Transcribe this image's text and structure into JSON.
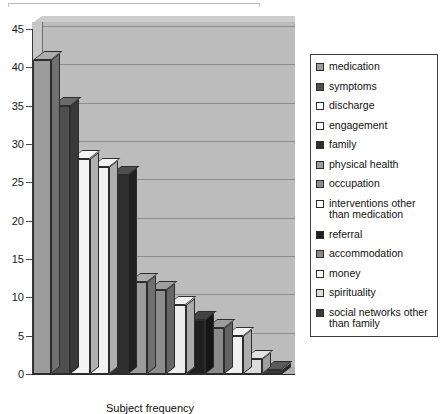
{
  "chart_data": {
    "type": "bar",
    "title": "",
    "xlabel": "Subject frequency",
    "ylabel": "",
    "ylim": [
      0,
      45
    ],
    "ytick_step": 5,
    "yticks": [
      45,
      40,
      35,
      30,
      25,
      20,
      15,
      10,
      5,
      0
    ],
    "grid": true,
    "legend_position": "right",
    "style": "3d-bar",
    "categories": [
      "medication",
      "symptoms",
      "discharge",
      "engagement",
      "family",
      "physical health",
      "occupation",
      "interventions other than medication",
      "referral",
      "accommodation",
      "money",
      "spirituality",
      "social networks other than family"
    ],
    "values": [
      41,
      35,
      28,
      27,
      26,
      12,
      11,
      9,
      7,
      6,
      5,
      2,
      0.5
    ],
    "colors": [
      "#9c9c9c",
      "#4f4f4f",
      "#f4f4f4",
      "#f2f2f2",
      "#2e2e2e",
      "#9c9c9c",
      "#8d8d8d",
      "#ededed",
      "#1f1f1f",
      "#8a8a8a",
      "#f0f0f0",
      "#dcdcdc",
      "#3a3a3a"
    ]
  },
  "legend": {
    "items": [
      {
        "label": "medication",
        "color": "#9c9c9c"
      },
      {
        "label": "symptoms",
        "color": "#4f4f4f"
      },
      {
        "label": "discharge",
        "color": "#fcfcfc"
      },
      {
        "label": "engagement",
        "color": "#fcfcfc"
      },
      {
        "label": "family",
        "color": "#2e2e2e"
      },
      {
        "label": "physical health",
        "color": "#9c9c9c"
      },
      {
        "label": "occupation",
        "color": "#8d8d8d"
      },
      {
        "label": "interventions other than medication",
        "color": "#fcfcfc"
      },
      {
        "label": "referral",
        "color": "#1f1f1f"
      },
      {
        "label": "accommodation",
        "color": "#8a8a8a"
      },
      {
        "label": "money",
        "color": "#fcfcfc"
      },
      {
        "label": "spirituality",
        "color": "#dcdcdc"
      },
      {
        "label": "social networks other than family",
        "color": "#3a3a3a"
      }
    ]
  }
}
